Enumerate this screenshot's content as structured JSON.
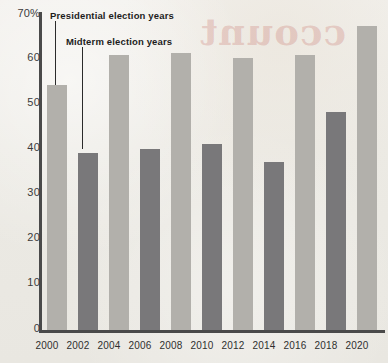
{
  "ghost_text": "ccount",
  "axis": {
    "y_ticks": [
      "70%",
      "60",
      "50",
      "40",
      "30",
      "20",
      "10",
      "0"
    ],
    "x_ticks": [
      "2000",
      "2002",
      "2004",
      "2006",
      "2008",
      "2010",
      "2012",
      "2014",
      "2016",
      "2018",
      "2020"
    ]
  },
  "legend": {
    "presidential": "Presidential election years",
    "midterm": "Midterm election years"
  },
  "colors": {
    "presidential_bar": "#b2b0ab",
    "midterm_bar": "#79787a",
    "axis": "#4a4a4a",
    "background": "#eceae5",
    "ghost": "#c46860"
  },
  "chart_data": {
    "type": "bar",
    "title": "",
    "xlabel": "",
    "ylabel": "",
    "ylim": [
      0,
      70
    ],
    "grid": false,
    "legend_position": "inside-top-left",
    "categories": [
      "2000",
      "2002",
      "2004",
      "2006",
      "2008",
      "2010",
      "2012",
      "2014",
      "2016",
      "2018",
      "2020"
    ],
    "values": [
      54,
      39,
      60.5,
      40,
      61,
      41,
      60,
      37,
      60.5,
      48,
      67
    ],
    "point_types": [
      "presidential",
      "midterm",
      "presidential",
      "midterm",
      "presidential",
      "midterm",
      "presidential",
      "midterm",
      "presidential",
      "midterm",
      "presidential"
    ],
    "series": [
      {
        "name": "Presidential election years",
        "color": "#b2b0ab",
        "x": [
          "2000",
          "2004",
          "2008",
          "2012",
          "2016",
          "2020"
        ],
        "values": [
          54,
          60.5,
          61,
          60,
          60.5,
          67
        ]
      },
      {
        "name": "Midterm election years",
        "color": "#79787a",
        "x": [
          "2002",
          "2006",
          "2010",
          "2014",
          "2018"
        ],
        "values": [
          39,
          40,
          41,
          37,
          48
        ]
      }
    ],
    "annotations": [
      {
        "text": "Presidential election years",
        "points_to": "2000"
      },
      {
        "text": "Midterm election years",
        "points_to": "2002"
      }
    ]
  }
}
